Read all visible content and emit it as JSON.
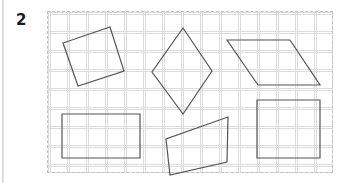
{
  "page": {
    "width": 348,
    "height": 183,
    "background_color": "#ffffff"
  },
  "question": {
    "number_label": "2"
  },
  "grid_panel": {
    "x": 47,
    "y": 11,
    "width": 286,
    "height": 162,
    "border_style": "dashed",
    "border_color": "#c2c2c2",
    "grid_color": "#dcdcdc",
    "grid_spacing": 19,
    "background_color": "#ffffff"
  },
  "shapes": {
    "stroke_color": "#555555",
    "stroke_width": 1.2,
    "fill": "none",
    "items": [
      {
        "name": "tilted-square",
        "label": "Tilted square",
        "points": "110,27 124,71 78,86 63,43"
      },
      {
        "name": "kite-diamond",
        "label": "Kite / diamond",
        "points": "183,28 212,71 183,114 152,72"
      },
      {
        "name": "parallelogram",
        "label": "Parallelogram",
        "points": "227,40 290,40 320,85 258,85"
      },
      {
        "name": "rectangle-wide",
        "label": "Wide rectangle",
        "points": "62,114 140,114 140,158 62,158"
      },
      {
        "name": "trapezoid",
        "label": "Trapezoid",
        "points": "228,117 227,162 170,175 166,139"
      },
      {
        "name": "rectangle-square",
        "label": "Square-ish rectangle",
        "points": "257,100 320,100 320,158 257,158"
      }
    ]
  }
}
